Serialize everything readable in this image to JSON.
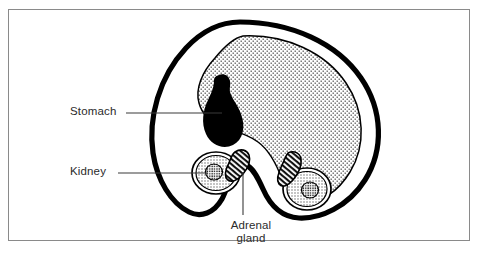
{
  "figure": {
    "kind": "anatomical-cross-section-diagram",
    "background_color": "#ffffff",
    "frame_color": "#8a8a8a",
    "outline_color": "#000000",
    "text_color": "#2b2b2b"
  },
  "labels": {
    "stomach": "Stomach",
    "kidney": "Kidney",
    "adrenal_line1": "Adrenal",
    "adrenal_line2": "gland"
  },
  "structures": [
    {
      "name": "body-outline",
      "label": "Body wall cross-section",
      "fill": "#ffffff",
      "stroke": "#000000",
      "style": "thick-black-outline"
    },
    {
      "name": "liver-mass",
      "label": "Liver",
      "fill": "stipple",
      "stroke": "#000000",
      "style": "stippled-dotted"
    },
    {
      "name": "stomach",
      "label": "Stomach",
      "fill": "#000000",
      "style": "solid-black-teardrop"
    },
    {
      "name": "kidney-left",
      "label": "Kidney",
      "fill": "stipple",
      "stroke": "#000000",
      "style": "stippled-ring-with-dark-medulla"
    },
    {
      "name": "kidney-right",
      "label": "Kidney",
      "fill": "stipple",
      "stroke": "#000000",
      "style": "stippled-ring-with-dark-medulla"
    },
    {
      "name": "adrenal-gland-left",
      "label": "Adrenal gland",
      "fill": "hatch",
      "stroke": "#000000",
      "style": "hatched-elongated-cap"
    },
    {
      "name": "adrenal-gland-right",
      "label": "Adrenal gland",
      "fill": "hatch",
      "stroke": "#000000",
      "style": "hatched-elongated-cap"
    }
  ],
  "leader_lines": [
    {
      "name": "stomach-leader",
      "from": "Stomach label",
      "to": "stomach"
    },
    {
      "name": "kidney-leader",
      "from": "Kidney label",
      "to": "kidney-left"
    },
    {
      "name": "adrenal-leader",
      "from": "Adrenal gland label",
      "to": "adrenal-gland-left"
    }
  ]
}
